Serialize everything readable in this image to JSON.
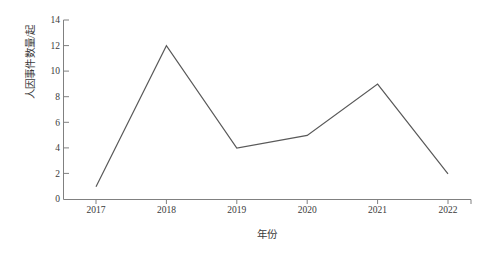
{
  "chart_data": {
    "type": "line",
    "title": "",
    "xlabel": "年份",
    "ylabel": "人因事件数量/起",
    "categories": [
      "2017",
      "2018",
      "2019",
      "2020",
      "2021",
      "2022"
    ],
    "values": [
      1,
      12,
      4,
      5,
      9,
      2
    ],
    "series": [
      {
        "name": "人因事件数量",
        "values": [
          1,
          12,
          4,
          5,
          9,
          2
        ]
      }
    ],
    "yticks": [
      "0",
      "2",
      "4",
      "6",
      "8",
      "10",
      "12",
      "14"
    ],
    "ytick_values": [
      0,
      2,
      4,
      6,
      8,
      10,
      12,
      14
    ],
    "xtick_labels": [
      "2017",
      "2018",
      "2019",
      "2020",
      "2021",
      "2022"
    ],
    "ylim": [
      0,
      14
    ],
    "grid": false,
    "legend": false,
    "legend_position": "none",
    "markers": false,
    "line_color": "#595959",
    "axis_color": "#808080",
    "background_color": "#ffffff",
    "text_color": "#3a3a3a"
  },
  "axis": {
    "y_title": "人因事件数量/起",
    "x_title": "年份"
  }
}
